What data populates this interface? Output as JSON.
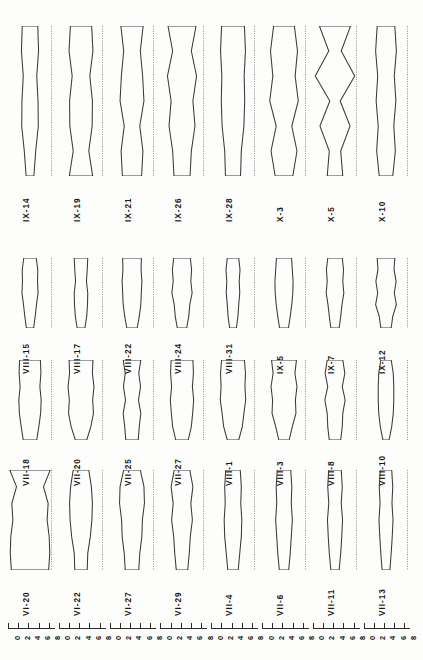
{
  "figure": {
    "orientation": "rotated-90",
    "background_color": "#fdfdfc",
    "line_color": "#3a3a3a",
    "axis_color": "#808080",
    "panel_count": 32,
    "row_count": 4,
    "columns_per_row": 8
  },
  "axis": {
    "tick_labels": [
      "0",
      "2",
      "4",
      "6",
      "8"
    ],
    "tick_values": [
      0,
      2,
      4,
      6,
      8
    ],
    "group_count": 8,
    "repeat_label_sequence": "0 2 4 6 8"
  },
  "chart_data": {
    "type": "area",
    "title": "",
    "subtitle": "",
    "xlabel": "",
    "ylabel": "",
    "xlim": [
      0,
      8
    ],
    "grid": false,
    "legend": "none",
    "rows": [
      {
        "row_index": 0,
        "panels": [
          {
            "label": "IX-14",
            "baseline": 4.0,
            "values": [
              3.0,
              3.3,
              2.6,
              3.1,
              3.2,
              2.2,
              1.5
            ]
          },
          {
            "label": "IX-19",
            "baseline": 4.0,
            "values": [
              4.1,
              4.6,
              3.4,
              4.4,
              4.3,
              3.0,
              4.5
            ]
          },
          {
            "label": "IX-21",
            "baseline": 4.0,
            "values": [
              4.3,
              3.2,
              4.1,
              4.6,
              3.0,
              4.2,
              3.7
            ]
          },
          {
            "label": "IX-26",
            "baseline": 4.0,
            "values": [
              5.4,
              3.6,
              5.6,
              4.2,
              5.0,
              3.6,
              3.1
            ]
          },
          {
            "label": "IX-28",
            "baseline": 4.0,
            "values": [
              4.4,
              4.8,
              4.3,
              4.5,
              4.2,
              3.2,
              2.9
            ]
          },
          {
            "label": "X-3",
            "baseline": 4.0,
            "values": [
              4.0,
              5.2,
              4.3,
              5.5,
              3.0,
              5.0,
              3.4
            ]
          },
          {
            "label": "X-5",
            "baseline": 4.0,
            "values": [
              6.0,
              2.4,
              7.6,
              2.0,
              5.8,
              2.2,
              3.0
            ]
          },
          {
            "label": "X-10",
            "baseline": 4.0,
            "values": [
              3.4,
              4.0,
              3.2,
              3.8,
              3.0,
              3.6,
              2.6
            ]
          }
        ]
      },
      {
        "row_index": 1,
        "panels": [
          {
            "label": "VIII-15",
            "baseline": 4.0,
            "values": [
              2.4,
              3.0,
              2.9,
              3.1,
              2.5,
              2.0,
              1.4
            ]
          },
          {
            "label": "VIII-17",
            "baseline": 4.0,
            "values": [
              2.6,
              2.4,
              2.1,
              2.6,
              2.5,
              2.2,
              1.5
            ]
          },
          {
            "label": "VIII-22",
            "baseline": 4.0,
            "values": [
              3.6,
              3.5,
              3.8,
              3.6,
              3.4,
              2.8,
              2.0
            ]
          },
          {
            "label": "VIII-24",
            "baseline": 4.0,
            "values": [
              3.2,
              3.7,
              3.4,
              3.9,
              3.0,
              2.6,
              1.8
            ]
          },
          {
            "label": "VIII-31",
            "baseline": 4.0,
            "values": [
              2.2,
              2.7,
              2.4,
              2.6,
              2.2,
              1.9,
              1.3
            ]
          },
          {
            "label": "IX-5",
            "baseline": 4.0,
            "values": [
              2.9,
              3.2,
              3.5,
              3.4,
              3.0,
              2.4,
              1.7
            ]
          },
          {
            "label": "IX-7",
            "baseline": 4.0,
            "values": [
              2.8,
              3.3,
              3.0,
              3.4,
              2.7,
              2.2,
              1.6
            ]
          },
          {
            "label": "IX-12",
            "baseline": 4.0,
            "values": [
              3.4,
              3.1,
              3.9,
              3.2,
              4.0,
              2.6,
              2.0
            ]
          }
        ]
      },
      {
        "row_index": 2,
        "panels": [
          {
            "label": "VII-18",
            "baseline": 4.0,
            "values": [
              4.0,
              4.2,
              3.8,
              4.3,
              4.1,
              3.4,
              2.6
            ]
          },
          {
            "label": "VII-20",
            "baseline": 4.0,
            "values": [
              4.6,
              4.4,
              5.0,
              4.5,
              4.8,
              3.8,
              2.2
            ]
          },
          {
            "label": "VII-25",
            "baseline": 4.0,
            "values": [
              3.4,
              2.6,
              3.3,
              2.5,
              3.4,
              2.8,
              2.4
            ]
          },
          {
            "label": "VII-27",
            "baseline": 4.0,
            "values": [
              4.2,
              4.4,
              4.0,
              4.5,
              4.1,
              3.6,
              2.4
            ]
          },
          {
            "label": "VIII-1",
            "baseline": 4.0,
            "values": [
              4.4,
              4.8,
              4.6,
              4.9,
              4.2,
              3.6,
              2.2
            ]
          },
          {
            "label": "VIII-3",
            "baseline": 4.0,
            "values": [
              4.8,
              4.2,
              5.0,
              4.4,
              4.6,
              3.2,
              2.0
            ]
          },
          {
            "label": "VIII-8",
            "baseline": 4.0,
            "values": [
              3.0,
              3.8,
              2.8,
              3.9,
              3.0,
              2.8,
              2.2
            ]
          },
          {
            "label": "VIII-10",
            "baseline": 4.0,
            "values": [
              2.0,
              2.8,
              3.0,
              3.0,
              2.8,
              2.2,
              1.2
            ]
          }
        ]
      },
      {
        "row_index": 3,
        "panels": [
          {
            "label": "VI-20",
            "baseline": 4.0,
            "values": [
              7.8,
              5.2,
              7.0,
              6.6,
              7.4,
              7.6,
              7.2
            ]
          },
          {
            "label": "VI-22",
            "baseline": 4.0,
            "values": [
              3.0,
              4.0,
              4.4,
              4.2,
              3.6,
              2.6,
              2.4
            ]
          },
          {
            "label": "VI-27",
            "baseline": 4.0,
            "values": [
              3.2,
              4.6,
              4.8,
              4.0,
              3.8,
              3.0,
              2.6
            ]
          },
          {
            "label": "VI-29",
            "baseline": 4.0,
            "values": [
              3.0,
              4.2,
              3.4,
              4.0,
              3.2,
              2.8,
              2.2
            ]
          },
          {
            "label": "VII-4",
            "baseline": 4.0,
            "values": [
              2.8,
              3.2,
              3.0,
              3.4,
              3.2,
              2.6,
              2.0
            ]
          },
          {
            "label": "VII-6",
            "baseline": 4.0,
            "values": [
              2.6,
              3.0,
              2.8,
              3.2,
              2.8,
              2.4,
              1.8
            ]
          },
          {
            "label": "VII-11",
            "baseline": 4.0,
            "values": [
              2.4,
              2.8,
              2.4,
              2.9,
              2.6,
              2.2,
              1.6
            ]
          },
          {
            "label": "VII-13",
            "baseline": 4.0,
            "values": [
              2.2,
              2.6,
              2.3,
              2.7,
              2.4,
              2.0,
              1.5
            ]
          }
        ]
      }
    ]
  }
}
